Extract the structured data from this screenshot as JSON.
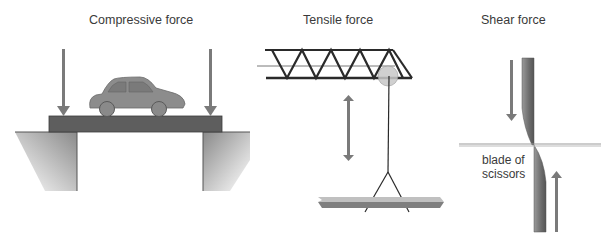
{
  "panels": {
    "compressive": {
      "title": "Compressive force"
    },
    "tensile": {
      "title": "Tensile force"
    },
    "shear": {
      "title": "Shear force",
      "annotation_line1": "blade of",
      "annotation_line2": "scissors"
    }
  },
  "colors": {
    "arrow": "#7a7a7a",
    "beam": "#5e5e5e",
    "car": "#8c8c8c",
    "ground_dark": "#8a8a8a",
    "truss": "#2a2a2a",
    "pulley": "#c8c8c8",
    "load_light": "#bdbdbd",
    "load_dark": "#7f7f7f",
    "blade": "#7d7d7d"
  }
}
